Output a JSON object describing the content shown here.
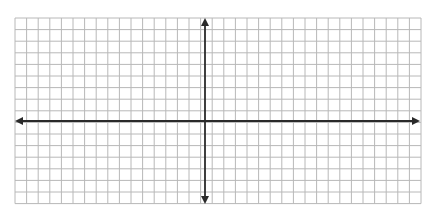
{
  "diagram": {
    "type": "coordinate-grid",
    "grid": {
      "columns": 35,
      "rows": 16,
      "left": 15,
      "top": 18,
      "cell": 11.6,
      "line_color": "#b8b8b8"
    },
    "axes": {
      "color": "#2a2a2a",
      "x_axis": {
        "y": 121,
        "x_start": 15,
        "x_end": 420,
        "arrows": "both"
      },
      "y_axis": {
        "x": 205,
        "y_start": 18,
        "y_end": 204,
        "arrows": "both"
      }
    },
    "labels": []
  }
}
